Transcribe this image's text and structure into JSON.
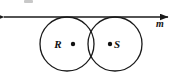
{
  "figure": {
    "type": "geometry-diagram",
    "background_color": "#ffffff",
    "stroke_color": "#1a1a1a",
    "label_color": "#111111",
    "width": 174,
    "height": 75,
    "line": {
      "name": "m",
      "label": "m",
      "label_x": 160,
      "label_y": 27,
      "y": 17,
      "x_start": 4,
      "x_end": 168,
      "arrow_left": true,
      "arrow_right": true
    },
    "circles": [
      {
        "name": "circle-R",
        "label": "R",
        "cx": 67,
        "cy": 44,
        "r": 27,
        "label_x": 58,
        "label_y": 48,
        "center_dot_x": 73,
        "center_dot_y": 44,
        "dot_r": 2.2
      },
      {
        "name": "circle-S",
        "label": "S",
        "cx": 115,
        "cy": 44,
        "r": 27,
        "label_x": 117,
        "label_y": 48,
        "center_dot_x": 110,
        "center_dot_y": 44,
        "dot_r": 2.2
      }
    ],
    "artifact": {
      "name": "clipped-text-artifact",
      "x": 24,
      "y": 0,
      "width": 9,
      "height": 3
    }
  }
}
